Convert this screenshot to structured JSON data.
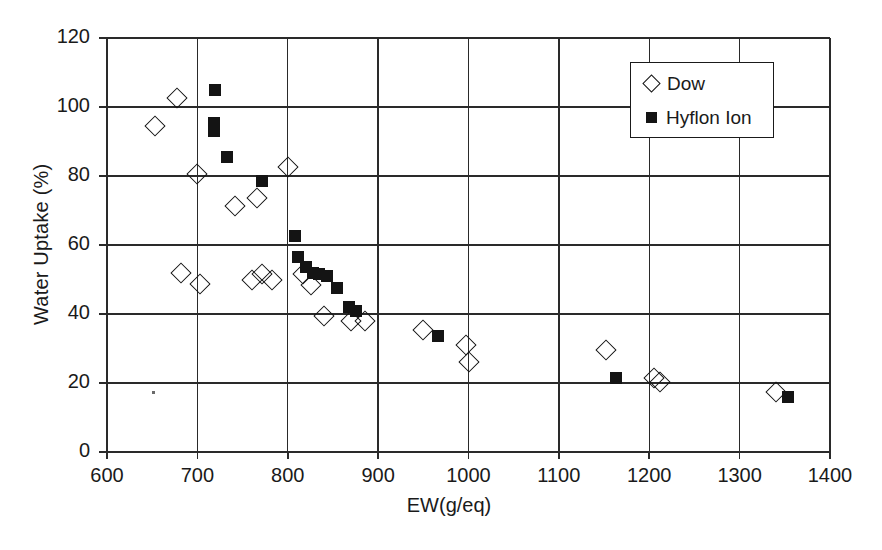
{
  "chart_data": {
    "type": "scatter",
    "title": "",
    "xlabel": "EW(g/eq)",
    "ylabel": "Water Uptake (%)",
    "xlim": [
      600,
      1400
    ],
    "ylim": [
      0,
      120
    ],
    "xticks": [
      600,
      700,
      800,
      900,
      1000,
      1100,
      1200,
      1300,
      1400
    ],
    "yticks": [
      0,
      20,
      40,
      60,
      80,
      100,
      120
    ],
    "grid": true,
    "legend_position": "top-right",
    "series": [
      {
        "name": "Dow",
        "marker": "open-diamond",
        "color": "#141414",
        "points": [
          [
            653,
            94.5
          ],
          [
            678,
            102.5
          ],
          [
            700,
            80.5
          ],
          [
            682,
            52.0
          ],
          [
            703,
            48.8
          ],
          [
            742,
            71.3
          ],
          [
            766,
            73.5
          ],
          [
            760,
            49.8
          ],
          [
            772,
            51.5
          ],
          [
            783,
            49.8
          ],
          [
            800,
            82.5
          ],
          [
            817,
            51.5
          ],
          [
            826,
            48.3
          ],
          [
            840,
            39.5
          ],
          [
            870,
            38.0
          ],
          [
            886,
            38.0
          ],
          [
            950,
            35.5
          ],
          [
            997,
            31.0
          ],
          [
            1000,
            26.0
          ],
          [
            1152,
            29.5
          ],
          [
            1205,
            21.5
          ],
          [
            1212,
            20.2
          ],
          [
            1340,
            17.5
          ]
        ]
      },
      {
        "name": "Hyflon Ion",
        "marker": "filled-square",
        "color": "#141414",
        "points": [
          [
            719,
            104.8
          ],
          [
            718,
            95.5
          ],
          [
            718,
            93.0
          ],
          [
            733,
            85.5
          ],
          [
            772,
            78.5
          ],
          [
            808,
            62.5
          ],
          [
            811,
            56.5
          ],
          [
            820,
            53.5
          ],
          [
            828,
            52.0
          ],
          [
            835,
            51.5
          ],
          [
            843,
            51.0
          ],
          [
            855,
            47.5
          ],
          [
            868,
            42.0
          ],
          [
            875,
            41.0
          ],
          [
            966,
            33.5
          ],
          [
            1163,
            21.5
          ],
          [
            1353,
            15.8
          ]
        ]
      }
    ]
  },
  "legend": {
    "items": [
      {
        "label": "Dow",
        "marker": "open-diamond"
      },
      {
        "label": "Hyflon Ion",
        "marker": "filled-square"
      }
    ]
  }
}
